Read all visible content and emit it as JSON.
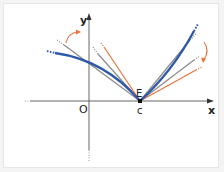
{
  "diagram": {
    "labels": {
      "y_axis": "y",
      "x_axis": "x",
      "origin": "O",
      "point": "E",
      "x_value": "c"
    },
    "colors": {
      "curve": "#2f5aa8",
      "secant": "#8a8a8a",
      "tangent": "#e8743b",
      "axis": "#666666"
    },
    "elements": [
      {
        "name": "blue-curve",
        "description": "curve with corner point E at x = c"
      },
      {
        "name": "gray-lines",
        "description": "secant lines through E"
      },
      {
        "name": "orange-lines",
        "description": "one-sided limit lines through E"
      },
      {
        "name": "orange-arrows",
        "description": "curved arrows indicating rotation"
      }
    ]
  }
}
